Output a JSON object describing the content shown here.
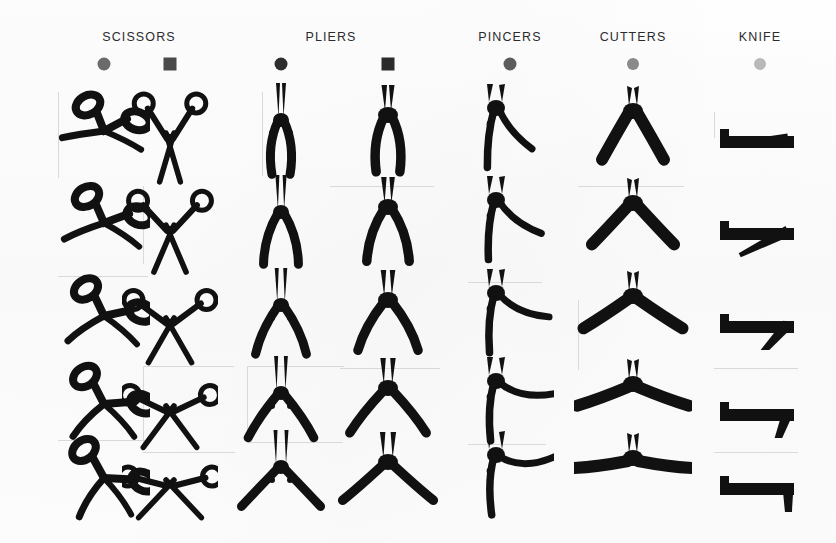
{
  "figure": {
    "type": "tool-silhouette-plate",
    "background_color": "#fdfdfd",
    "ink_color": "#111111",
    "bbox_color": "#d9d9d9",
    "rows": 5,
    "row_meaning": "progressive opening / articulation of each tool, top = closed, bottom = fully open"
  },
  "columns": [
    {
      "title": "SCISSORS",
      "title_x": 139,
      "markers": [
        {
          "shape": "circle",
          "color": "#6b6b6b",
          "x": 104,
          "y": 64,
          "size": 13
        },
        {
          "shape": "square",
          "color": "#4a4a4a",
          "x": 170,
          "y": 64,
          "size": 13
        }
      ]
    },
    {
      "title": "PLIERS",
      "title_x": 331,
      "markers": [
        {
          "shape": "circle",
          "color": "#2e2e2e",
          "x": 281,
          "y": 64,
          "size": 13
        },
        {
          "shape": "square",
          "color": "#2b2b2b",
          "x": 388,
          "y": 64,
          "size": 13
        }
      ]
    },
    {
      "title": "PINCERS",
      "title_x": 510,
      "markers": [
        {
          "shape": "circle",
          "color": "#5c5c5c",
          "x": 510,
          "y": 64,
          "size": 13
        }
      ]
    },
    {
      "title": "CUTTERS",
      "title_x": 633,
      "markers": [
        {
          "shape": "circle",
          "color": "#8a8a8a",
          "x": 633,
          "y": 64,
          "size": 12
        }
      ]
    },
    {
      "title": "KNIFE",
      "title_x": 760,
      "markers": [
        {
          "shape": "circle",
          "color": "#b9b9b9",
          "x": 760,
          "y": 64,
          "size": 12
        }
      ]
    }
  ],
  "title_y": 30,
  "row_centers": [
    133,
    225,
    318,
    406,
    480
  ],
  "cells": [
    {
      "name": "scissors-a-row1",
      "kind": "scissors",
      "variant": "a",
      "col_x": 104,
      "row": 0,
      "open": 0.0
    },
    {
      "name": "scissors-b-row1",
      "kind": "scissors",
      "variant": "b",
      "col_x": 170,
      "row": 0,
      "open": 0.0
    },
    {
      "name": "pliers-a-row1",
      "kind": "pliers",
      "variant": "a",
      "col_x": 281,
      "row": 0,
      "open": 0.0
    },
    {
      "name": "pliers-b-row1",
      "kind": "pliers",
      "variant": "b",
      "col_x": 388,
      "row": 0,
      "open": 0.0
    },
    {
      "name": "pincers-row1",
      "kind": "pincers",
      "variant": "a",
      "col_x": 510,
      "row": 0,
      "open": 0.0
    },
    {
      "name": "cutters-row1",
      "kind": "cutters",
      "variant": "a",
      "col_x": 633,
      "row": 0,
      "open": 0.0
    },
    {
      "name": "knife-row1",
      "kind": "knife",
      "variant": "a",
      "col_x": 760,
      "row": 0,
      "open": 0.0
    },
    {
      "name": "scissors-a-row2",
      "kind": "scissors",
      "variant": "a",
      "col_x": 104,
      "row": 1,
      "open": 0.25
    },
    {
      "name": "scissors-b-row2",
      "kind": "scissors",
      "variant": "b",
      "col_x": 170,
      "row": 1,
      "open": 0.25
    },
    {
      "name": "pliers-a-row2",
      "kind": "pliers",
      "variant": "a",
      "col_x": 281,
      "row": 1,
      "open": 0.25
    },
    {
      "name": "pliers-b-row2",
      "kind": "pliers",
      "variant": "b",
      "col_x": 388,
      "row": 1,
      "open": 0.25
    },
    {
      "name": "pincers-row2",
      "kind": "pincers",
      "variant": "a",
      "col_x": 510,
      "row": 1,
      "open": 0.25
    },
    {
      "name": "cutters-row2",
      "kind": "cutters",
      "variant": "a",
      "col_x": 633,
      "row": 1,
      "open": 0.25
    },
    {
      "name": "knife-row2",
      "kind": "knife",
      "variant": "a",
      "col_x": 760,
      "row": 1,
      "open": 0.25
    },
    {
      "name": "scissors-a-row3",
      "kind": "scissors",
      "variant": "a",
      "col_x": 104,
      "row": 2,
      "open": 0.5
    },
    {
      "name": "scissors-b-row3",
      "kind": "scissors",
      "variant": "b",
      "col_x": 170,
      "row": 2,
      "open": 0.5
    },
    {
      "name": "pliers-a-row3",
      "kind": "pliers",
      "variant": "a",
      "col_x": 281,
      "row": 2,
      "open": 0.5
    },
    {
      "name": "pliers-b-row3",
      "kind": "pliers",
      "variant": "b",
      "col_x": 388,
      "row": 2,
      "open": 0.5
    },
    {
      "name": "pincers-row3",
      "kind": "pincers",
      "variant": "a",
      "col_x": 510,
      "row": 2,
      "open": 0.5
    },
    {
      "name": "cutters-row3",
      "kind": "cutters",
      "variant": "a",
      "col_x": 633,
      "row": 2,
      "open": 0.5
    },
    {
      "name": "knife-row3",
      "kind": "knife",
      "variant": "a",
      "col_x": 760,
      "row": 2,
      "open": 0.5
    },
    {
      "name": "scissors-a-row4",
      "kind": "scissors",
      "variant": "a",
      "col_x": 104,
      "row": 3,
      "open": 0.75
    },
    {
      "name": "scissors-b-row4",
      "kind": "scissors",
      "variant": "b",
      "col_x": 170,
      "row": 3,
      "open": 0.75
    },
    {
      "name": "pliers-a-row4",
      "kind": "pliers",
      "variant": "a",
      "col_x": 281,
      "row": 3,
      "open": 0.75
    },
    {
      "name": "pliers-b-row4",
      "kind": "pliers",
      "variant": "b",
      "col_x": 388,
      "row": 3,
      "open": 0.75
    },
    {
      "name": "pincers-row4",
      "kind": "pincers",
      "variant": "a",
      "col_x": 510,
      "row": 3,
      "open": 0.75
    },
    {
      "name": "cutters-row4",
      "kind": "cutters",
      "variant": "a",
      "col_x": 633,
      "row": 3,
      "open": 0.75
    },
    {
      "name": "knife-row4",
      "kind": "knife",
      "variant": "a",
      "col_x": 760,
      "row": 3,
      "open": 0.75
    },
    {
      "name": "scissors-a-row5",
      "kind": "scissors",
      "variant": "a",
      "col_x": 104,
      "row": 4,
      "open": 1.0
    },
    {
      "name": "scissors-b-row5",
      "kind": "scissors",
      "variant": "b",
      "col_x": 170,
      "row": 4,
      "open": 1.0
    },
    {
      "name": "pliers-a-row5",
      "kind": "pliers",
      "variant": "a",
      "col_x": 281,
      "row": 4,
      "open": 1.0
    },
    {
      "name": "pliers-b-row5",
      "kind": "pliers",
      "variant": "b",
      "col_x": 388,
      "row": 4,
      "open": 1.0
    },
    {
      "name": "pincers-row5",
      "kind": "pincers",
      "variant": "a",
      "col_x": 510,
      "row": 4,
      "open": 1.0
    },
    {
      "name": "cutters-row5",
      "kind": "cutters",
      "variant": "a",
      "col_x": 633,
      "row": 4,
      "open": 1.0
    },
    {
      "name": "knife-row5",
      "kind": "knife",
      "variant": "a",
      "col_x": 760,
      "row": 4,
      "open": 1.0
    }
  ],
  "bboxes": [
    {
      "x": 58,
      "y": 92,
      "w": 0,
      "h": 86,
      "edges": "left"
    },
    {
      "x": 143,
      "y": 186,
      "w": 0,
      "h": 78,
      "edges": "left"
    },
    {
      "x": 58,
      "y": 276,
      "w": 90,
      "h": 0,
      "edges": "top"
    },
    {
      "x": 143,
      "y": 366,
      "w": 90,
      "h": 76,
      "edges": "both"
    },
    {
      "x": 58,
      "y": 440,
      "w": 90,
      "h": 0,
      "edges": "top"
    },
    {
      "x": 143,
      "y": 452,
      "w": 92,
      "h": 0,
      "edges": "top"
    },
    {
      "x": 262,
      "y": 92,
      "w": 0,
      "h": 84,
      "edges": "left"
    },
    {
      "x": 330,
      "y": 186,
      "w": 104,
      "h": 0,
      "edges": "top"
    },
    {
      "x": 247,
      "y": 366,
      "w": 96,
      "h": 72,
      "edges": "both"
    },
    {
      "x": 340,
      "y": 368,
      "w": 100,
      "h": 0,
      "edges": "top"
    },
    {
      "x": 247,
      "y": 442,
      "w": 96,
      "h": 0,
      "edges": "top"
    },
    {
      "x": 468,
      "y": 282,
      "w": 74,
      "h": 0,
      "edges": "top"
    },
    {
      "x": 468,
      "y": 444,
      "w": 78,
      "h": 0,
      "edges": "top"
    },
    {
      "x": 578,
      "y": 186,
      "w": 106,
      "h": 0,
      "edges": "top"
    },
    {
      "x": 578,
      "y": 300,
      "w": 0,
      "h": 70,
      "edges": "left"
    },
    {
      "x": 714,
      "y": 112,
      "w": 0,
      "h": 26,
      "edges": "left"
    },
    {
      "x": 714,
      "y": 368,
      "w": 84,
      "h": 0,
      "edges": "top"
    },
    {
      "x": 714,
      "y": 452,
      "w": 84,
      "h": 0,
      "edges": "top"
    }
  ]
}
